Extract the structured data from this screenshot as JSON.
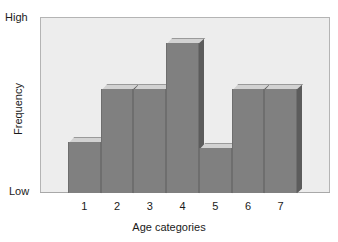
{
  "chart_data": {
    "type": "bar",
    "title": "",
    "subtitle": "",
    "xlabel": "Age categories",
    "ylabel": "Frequency",
    "categories": [
      "1",
      "2",
      "3",
      "4",
      "5",
      "6",
      "7"
    ],
    "values": [
      34,
      69,
      69,
      100,
      30,
      69,
      69
    ],
    "ylim": [
      0,
      117
    ],
    "y_tick_labels": [
      "Low",
      "High"
    ],
    "y_axis_low_label": "Low",
    "y_axis_high_label": "High",
    "grid": false,
    "legend": false,
    "legend_position": "none",
    "style": "3d-extruded-bars",
    "annotations": [],
    "series": [
      {
        "name": "Frequency",
        "values": [
          34,
          69,
          69,
          100,
          30,
          69,
          69
        ]
      }
    ]
  },
  "colors": {
    "plot_background": "#ededed",
    "plot_border": "#b4b4b4",
    "page_background": "#ffffff",
    "bar_front": "#808080",
    "bar_top": "#d2d2d2",
    "bar_side": "#5c5c5c",
    "bar_edge": "#6e6e6e",
    "text": "#1a1a1a",
    "baseline": "#a8a8a8"
  }
}
